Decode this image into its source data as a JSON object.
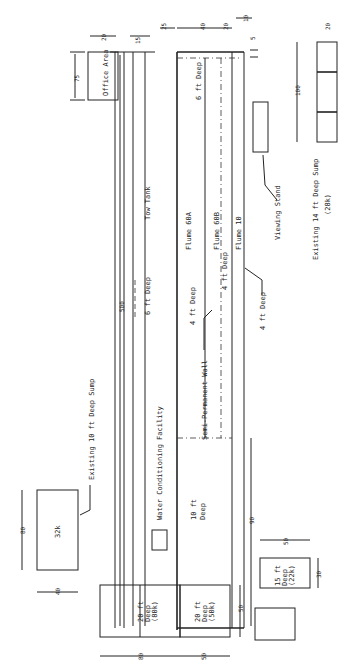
{
  "diagram": {
    "orientation": "rotated 90° counter-clockwise",
    "labels": {
      "office_area": "Office Area",
      "tow_tank": "Tow Tank",
      "flume_60a": "Flume 60A",
      "flume_60b": "Flume 60B",
      "flume_10": "Flume 10",
      "viewing_stand": "Viewing Stand",
      "existing_14ft_sump": "Existing 14 ft Deep Sump",
      "existing_14ft_sump_cap": "(28k)",
      "existing_10ft_sump": "Existing 10 ft Deep Sump",
      "sump_32k": "32k",
      "water_conditioning": "Water Conditioning Facility",
      "semi_permanent_wall": "Semi-Permanent Wall",
      "depth_6ft_tow": "6 ft Deep",
      "depth_6ft_flume": "6 ft Deep",
      "depth_4ft_60a": "4 ft Deep",
      "depth_4ft_60b": "4 ft Deep",
      "depth_4ft_flume10": "4 ft Deep",
      "depth_10ft_a": "10 ft",
      "depth_10ft_b": "Deep",
      "pit_20ft_80k_a": "20 ft",
      "pit_20ft_80k_b": "Deep",
      "pit_20ft_80k_c": "(80k)",
      "pit_20ft_50k_a": "20 ft",
      "pit_20ft_50k_b": "Deep",
      "pit_20ft_50k_c": "(50k)",
      "pit_15ft_a": "15 ft",
      "pit_15ft_b": "Deep",
      "pit_15ft_c": "(22k)"
    },
    "dimensions": {
      "d500": "500",
      "d75": "75",
      "d20_office": "20",
      "d15": "15",
      "d25": "25",
      "d40": "40",
      "d20": "20",
      "d10": "10",
      "d5": "5",
      "d100": "100",
      "d20_sump": "20",
      "d90": "90",
      "d80_sump": "80",
      "d40_sump": "40",
      "d50_a": "50",
      "d30": "30",
      "d80_pit": "80",
      "d50_pit": "50",
      "d50_pit2": "50"
    }
  }
}
